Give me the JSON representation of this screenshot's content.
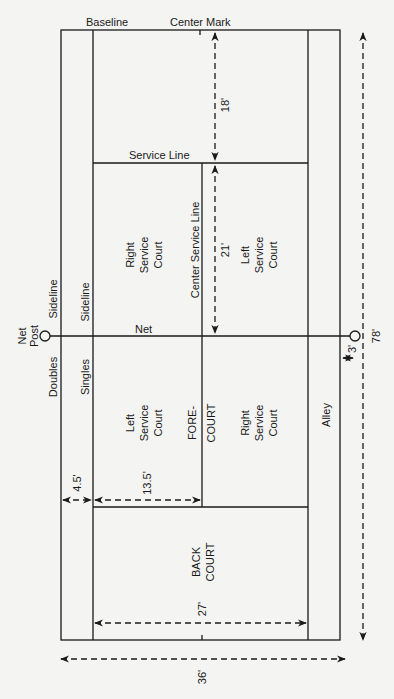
{
  "diagram": {
    "top_labels": {
      "baseline": "Baseline",
      "center_mark": "Center Mark",
      "service_line": "Service Line",
      "net": "Net"
    },
    "side_labels": {
      "net_post_line1": "Net",
      "net_post_line2": "Post",
      "sideline_doubles": "Sideline",
      "sideline_singles": "Sideline",
      "doubles": "Doubles",
      "singles": "Singles",
      "alley": "Alley",
      "center_service_line": "Center Service Line"
    },
    "courts": {
      "top_right_service": [
        "Right",
        "Service",
        "Court"
      ],
      "top_left_service": [
        "Left",
        "Service",
        "Court"
      ],
      "bottom_left_service": [
        "Left",
        "Service",
        "Court"
      ],
      "bottom_right_service": [
        "Right",
        "Service",
        "Court"
      ],
      "forecourt": [
        "FORE-",
        "COURT"
      ],
      "backcourt": [
        "BACK",
        "COURT"
      ]
    },
    "dimensions": {
      "baseline_to_service": "18'",
      "service_to_net": "21'",
      "court_length": "78'",
      "post_offset": "3'",
      "alley_width": "4.5'",
      "half_singles_width": "13.5'",
      "singles_width": "27'",
      "doubles_width": "36'"
    },
    "colors": {
      "line": "#1a1a1a",
      "background": "#f4f4f2"
    }
  }
}
